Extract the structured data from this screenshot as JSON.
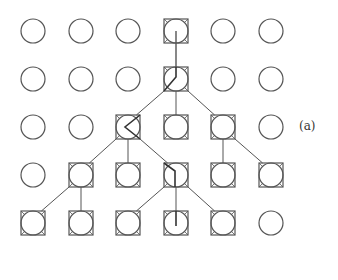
{
  "diagram": {
    "label": "(a)",
    "grid": {
      "rows": 5,
      "cols": 6
    },
    "colors": {
      "stroke": "#555555",
      "background": "#ffffff"
    },
    "nodes_boxed": [
      [
        1,
        4
      ],
      [
        2,
        4
      ],
      [
        3,
        3
      ],
      [
        3,
        4
      ],
      [
        3,
        5
      ],
      [
        4,
        2
      ],
      [
        4,
        3
      ],
      [
        4,
        4
      ],
      [
        4,
        5
      ],
      [
        4,
        6
      ],
      [
        5,
        1
      ],
      [
        5,
        2
      ],
      [
        5,
        3
      ],
      [
        5,
        4
      ],
      [
        5,
        5
      ]
    ],
    "edges": [
      [
        [
          2,
          4
        ],
        [
          3,
          3
        ]
      ],
      [
        [
          2,
          4
        ],
        [
          3,
          4
        ]
      ],
      [
        [
          2,
          4
        ],
        [
          3,
          5
        ]
      ],
      [
        [
          3,
          3
        ],
        [
          4,
          2
        ]
      ],
      [
        [
          3,
          3
        ],
        [
          4,
          3
        ]
      ],
      [
        [
          3,
          3
        ],
        [
          4,
          4
        ]
      ],
      [
        [
          3,
          5
        ],
        [
          4,
          5
        ]
      ],
      [
        [
          3,
          5
        ],
        [
          4,
          6
        ]
      ],
      [
        [
          4,
          2
        ],
        [
          5,
          1
        ]
      ],
      [
        [
          4,
          2
        ],
        [
          5,
          2
        ]
      ],
      [
        [
          4,
          4
        ],
        [
          5,
          3
        ]
      ],
      [
        [
          4,
          4
        ],
        [
          5,
          4
        ]
      ],
      [
        [
          4,
          4
        ],
        [
          5,
          5
        ]
      ]
    ],
    "paths_through_nodes": [
      {
        "node": [
          1,
          4
        ],
        "shape": "center-to-bottom"
      },
      {
        "node": [
          2,
          4
        ],
        "shape": "top-to-center-to-bottom-left"
      },
      {
        "node": [
          3,
          3
        ],
        "shape": "top-right-to-center-to-bottom-right"
      },
      {
        "node": [
          4,
          4
        ],
        "shape": "top-left-to-center-to-bottom"
      },
      {
        "node": [
          5,
          4
        ],
        "shape": "top-to-center"
      }
    ]
  }
}
